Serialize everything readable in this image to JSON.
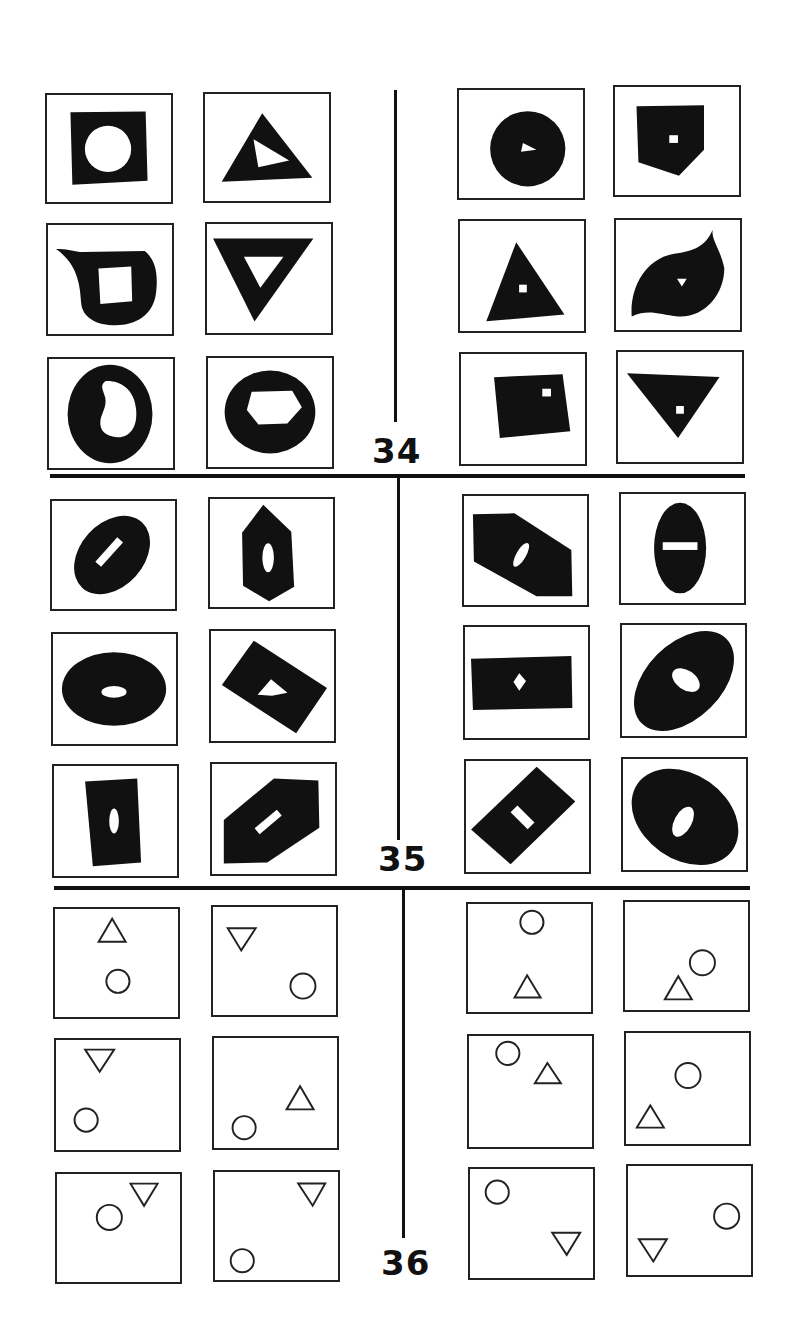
{
  "page": {
    "colors": {
      "ink": "#111111",
      "background": "#ffffff"
    }
  },
  "problems": [
    {
      "number": "34",
      "left": [
        {
          "shape": "black square",
          "hole": "white circle"
        },
        {
          "shape": "black triangle",
          "hole": "white quadrilateral"
        },
        {
          "shape": "black teardrop",
          "hole": "white square"
        },
        {
          "shape": "black inverted triangle",
          "hole": "white inverted triangle"
        },
        {
          "shape": "black circle",
          "hole": "white kidney shape"
        },
        {
          "shape": "black ellipse",
          "hole": "white hexagon"
        }
      ],
      "right": [
        {
          "shape": "black circle",
          "hole": "tiny white triangle"
        },
        {
          "shape": "black pentagon",
          "hole": "tiny white square"
        },
        {
          "shape": "black triangle",
          "hole": "tiny white square"
        },
        {
          "shape": "black leaf",
          "hole": "tiny white triangle"
        },
        {
          "shape": "black quadrilateral",
          "hole": "tiny white square"
        },
        {
          "shape": "black inverted triangle",
          "hole": "tiny white square"
        }
      ]
    },
    {
      "number": "35",
      "left": [
        {
          "shape": "black tilted ellipse",
          "hole": "white bar aligned with axis"
        },
        {
          "shape": "black vertical hexagon",
          "hole": "white vertical oval"
        },
        {
          "shape": "black horizontal ellipse",
          "hole": "white horizontal oval"
        },
        {
          "shape": "black tilted rectangle",
          "hole": "white diamond aligned"
        },
        {
          "shape": "black vertical rectangle",
          "hole": "white vertical oval"
        },
        {
          "shape": "black tilted hexagon",
          "hole": "white bar aligned"
        }
      ],
      "right": [
        {
          "shape": "black tilted hexagon",
          "hole": "white oval perpendicular"
        },
        {
          "shape": "black vertical ellipse",
          "hole": "white horizontal bar"
        },
        {
          "shape": "black horizontal rectangle",
          "hole": "small white diamond"
        },
        {
          "shape": "black tilted ellipse",
          "hole": "white oval perpendicular"
        },
        {
          "shape": "black tilted rectangle",
          "hole": "white bar perpendicular"
        },
        {
          "shape": "black tilted ellipse",
          "hole": "white oval perpendicular"
        }
      ]
    },
    {
      "number": "36",
      "left": [
        {
          "triangle": "up",
          "triangle_pos": "top",
          "circle_pos": "bottom"
        },
        {
          "triangle": "down",
          "triangle_pos": "top-left",
          "circle_pos": "bottom-right"
        },
        {
          "triangle": "down",
          "triangle_pos": "top-left",
          "circle_pos": "bottom-left"
        },
        {
          "triangle": "up",
          "triangle_pos": "right",
          "circle_pos": "bottom-left"
        },
        {
          "triangle": "down",
          "triangle_pos": "top-right",
          "circle_pos": "center-left"
        },
        {
          "triangle": "down",
          "triangle_pos": "top-right",
          "circle_pos": "bottom-left"
        }
      ],
      "right": [
        {
          "triangle": "up",
          "triangle_pos": "bottom",
          "circle_pos": "top"
        },
        {
          "triangle": "up",
          "triangle_pos": "bottom-center",
          "circle_pos": "right"
        },
        {
          "triangle": "up",
          "triangle_pos": "top-center",
          "circle_pos": "top-left"
        },
        {
          "triangle": "up",
          "triangle_pos": "bottom-left",
          "circle_pos": "center"
        },
        {
          "triangle": "down",
          "triangle_pos": "bottom-right",
          "circle_pos": "top-left"
        },
        {
          "triangle": "down",
          "triangle_pos": "bottom-left",
          "circle_pos": "right"
        }
      ]
    }
  ]
}
